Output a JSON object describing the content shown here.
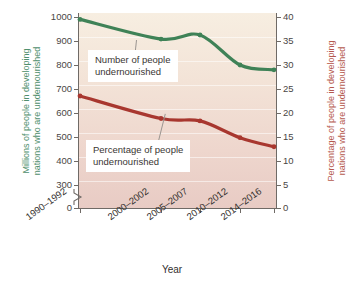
{
  "chart_data": {
    "type": "line",
    "title": "",
    "xlabel": "Year",
    "grid": true,
    "legend_position": "inline-callouts",
    "categories": [
      "1990–1992",
      "2000–2002",
      "2005–2007",
      "2010–2012",
      "2014–2016"
    ],
    "series": [
      {
        "name": "Number of people undernourished",
        "axis": "left",
        "unit": "millions",
        "color": "#3f8257",
        "values": [
          990,
          908,
          925,
          800,
          780
        ]
      },
      {
        "name": "Percentage of people undernourished",
        "axis": "right",
        "unit": "percent",
        "color": "#a8372f",
        "values": [
          23.5,
          18.8,
          18.3,
          14.8,
          12.9
        ]
      }
    ],
    "left_axis": {
      "label_line1": "Millions of people in developing",
      "label_line2": "nations who are undernourished",
      "color": "#4f8f6d",
      "ticks": [
        0,
        300,
        400,
        500,
        600,
        700,
        800,
        900,
        1000
      ],
      "ticklabels": [
        "0",
        "300",
        "400",
        "500",
        "600",
        "700",
        "800",
        "900",
        "1000"
      ],
      "ylim": [
        300,
        1000
      ],
      "has_break": true
    },
    "right_axis": {
      "label_line1": "Percentage of people in developing",
      "label_line2": "nations who are undernourished",
      "color": "#b5594e",
      "ticks": [
        0,
        5,
        10,
        15,
        20,
        25,
        30,
        35,
        40
      ],
      "ticklabels": [
        "0",
        "5",
        "10",
        "15",
        "20",
        "25",
        "30",
        "35",
        "40"
      ],
      "ylim": [
        0,
        40
      ]
    },
    "annotations": [
      {
        "name": "green-callout",
        "line1": "Number of people",
        "line2": "undernourished"
      },
      {
        "name": "red-callout",
        "line1": "Percentage of people",
        "line2": "undernourished"
      }
    ]
  }
}
